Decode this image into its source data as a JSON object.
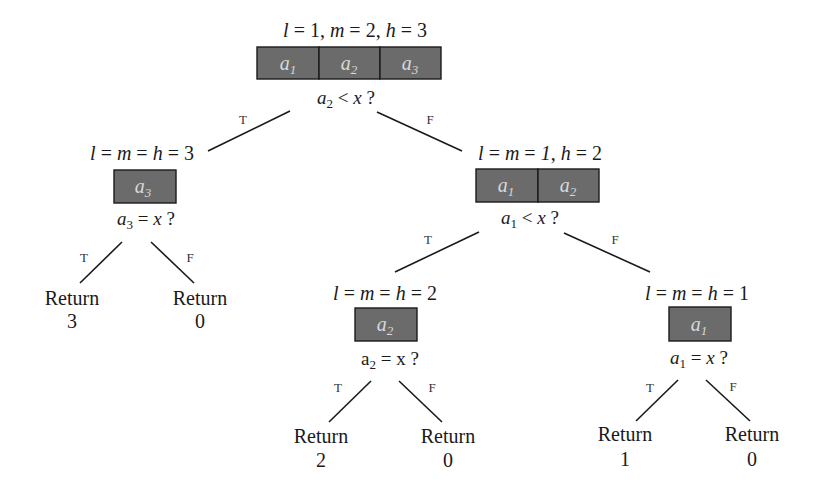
{
  "diagram": {
    "type": "binary-search-decision-tree",
    "nodes": {
      "root": {
        "header": "l = 1, m = 2, h = 3",
        "cells": [
          "a1",
          "a2",
          "a3"
        ],
        "condition": "a2 < x ?"
      },
      "left": {
        "header": "l = m = h = 3",
        "cells": [
          "a3"
        ],
        "condition": "a3 = x ?"
      },
      "right": {
        "header": "l = m = 1, h = 2",
        "cells": [
          "a1",
          "a2"
        ],
        "condition": "a1 < x ?"
      },
      "right_left": {
        "header": "l = m = h = 2",
        "cells": [
          "a2"
        ],
        "condition": "a2 = x ?"
      },
      "right_right": {
        "header": "l = m = h = 1",
        "cells": [
          "a1"
        ],
        "condition": "a1 = x ?"
      }
    },
    "leaves": [
      {
        "label": "Return",
        "value": "3"
      },
      {
        "label": "Return",
        "value": "0"
      },
      {
        "label": "Return",
        "value": "2"
      },
      {
        "label": "Return",
        "value": "0"
      },
      {
        "label": "Return",
        "value": "1"
      },
      {
        "label": "Return",
        "value": "0"
      }
    ],
    "edge_labels": {
      "true": "T",
      "false": "F"
    },
    "colors": {
      "cell_fill": "#6b6b6b",
      "cell_text": "#d8d8d8",
      "line": "#1a1a1a",
      "background": "#ffffff"
    }
  }
}
